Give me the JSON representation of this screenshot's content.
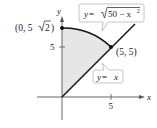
{
  "diagram": {
    "type": "region-plot",
    "axes": {
      "x_label": "x",
      "y_label": "y",
      "x_ticks": [
        {
          "value": 5,
          "label": "5"
        }
      ],
      "y_ticks": [
        {
          "value": 5,
          "label": "5"
        }
      ]
    },
    "curves": [
      {
        "name": "circle-arc",
        "equation_label": "y = √50 − x²",
        "label_parts": {
          "lhs": "y",
          "eq": " = ",
          "radicand": "50 − x",
          "exp": "2"
        }
      },
      {
        "name": "line",
        "equation_label": "y = x",
        "label_parts": {
          "lhs": "y",
          "eq": " = ",
          "rhs": "x"
        }
      }
    ],
    "points": [
      {
        "label": "(0, 5√2)",
        "label_parts": {
          "open": "(0, 5",
          "radicand": "2",
          "close": ")"
        },
        "x": 0,
        "y": 7.071
      },
      {
        "label": "(5, 5)",
        "x": 5,
        "y": 5
      }
    ],
    "shaded_region": "Region bounded by x = 0, y = x, and y = √(50 − x²)",
    "colors": {
      "axis": "#555555",
      "curve": "#111111",
      "shade": "#e6e6e6",
      "callout_border": "#b5b5b5"
    }
  }
}
